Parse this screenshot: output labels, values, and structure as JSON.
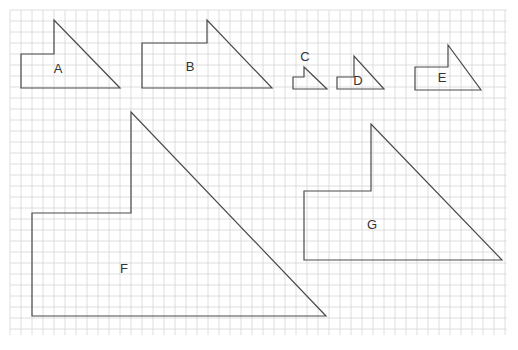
{
  "diagram": {
    "grid": {
      "x0": 10,
      "y0": 10,
      "x1": 507,
      "y1": 335,
      "cell": 11,
      "color": "#d6d6d6"
    },
    "stroke_color": "#4a4a4a",
    "shapes": [
      {
        "id": "A",
        "label": "A",
        "points": [
          [
            21,
            88
          ],
          [
            21,
            54
          ],
          [
            54,
            54
          ],
          [
            54,
            20
          ],
          [
            120,
            88
          ]
        ],
        "label_pos": [
          58,
          70
        ]
      },
      {
        "id": "B",
        "label": "B",
        "points": [
          [
            142,
            88
          ],
          [
            142,
            43
          ],
          [
            207,
            43
          ],
          [
            207,
            20
          ],
          [
            272,
            88
          ]
        ],
        "label_pos": [
          190,
          68
        ]
      },
      {
        "id": "C",
        "label": "C",
        "points": [
          [
            293,
            89
          ],
          [
            293,
            77
          ],
          [
            304,
            77
          ],
          [
            304,
            67
          ],
          [
            327,
            89
          ]
        ],
        "label_pos": [
          305,
          58
        ]
      },
      {
        "id": "D",
        "label": "D",
        "points": [
          [
            337,
            89
          ],
          [
            337,
            77
          ],
          [
            354,
            77
          ],
          [
            354,
            56
          ],
          [
            384,
            89
          ]
        ],
        "label_pos": [
          358,
          82
        ]
      },
      {
        "id": "E",
        "label": "E",
        "points": [
          [
            415,
            90
          ],
          [
            415,
            67
          ],
          [
            448,
            67
          ],
          [
            448,
            45
          ],
          [
            481,
            90
          ]
        ],
        "label_pos": [
          442,
          79
        ]
      },
      {
        "id": "F",
        "label": "F",
        "points": [
          [
            32,
            316
          ],
          [
            32,
            213
          ],
          [
            131,
            213
          ],
          [
            131,
            112
          ],
          [
            326,
            316
          ]
        ],
        "label_pos": [
          124,
          270
        ]
      },
      {
        "id": "G",
        "label": "G",
        "points": [
          [
            304,
            260
          ],
          [
            304,
            191
          ],
          [
            371,
            191
          ],
          [
            371,
            124
          ],
          [
            502,
            260
          ]
        ],
        "label_pos": [
          372,
          226
        ]
      }
    ]
  }
}
